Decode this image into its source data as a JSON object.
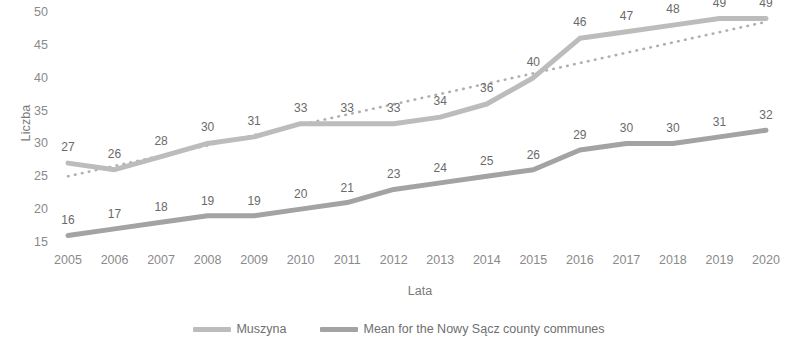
{
  "chart_data": {
    "type": "line",
    "title": "",
    "xlabel": "Lata",
    "ylabel": "Liczba",
    "categories": [
      "2005",
      "2006",
      "2007",
      "2008",
      "2009",
      "2010",
      "2011",
      "2012",
      "2013",
      "2014",
      "2015",
      "2016",
      "2017",
      "2018",
      "2019",
      "2020"
    ],
    "ylim": [
      15,
      50
    ],
    "yticks": [
      15,
      20,
      25,
      30,
      35,
      40,
      45,
      50
    ],
    "grid": false,
    "legend_position": "bottom",
    "series": [
      {
        "name": "Muszyna",
        "color": "#bcbcbc",
        "values": [
          27,
          26,
          28,
          30,
          31,
          33,
          33,
          33,
          34,
          36,
          40,
          46,
          47,
          48,
          49,
          49
        ],
        "labels": [
          "27",
          "26",
          "28",
          "30",
          "31",
          "33",
          "33",
          "33",
          "34",
          "36",
          "40",
          "46",
          "47",
          "48",
          "49",
          "49"
        ]
      },
      {
        "name": "Mean for the Nowy Sącz county communes",
        "color": "#a3a3a3",
        "values": [
          16,
          17,
          18,
          19,
          19,
          20,
          21,
          23,
          24,
          25,
          26,
          29,
          30,
          30,
          31,
          32
        ],
        "labels": [
          "16",
          "17",
          "18",
          "19",
          "19",
          "20",
          "21",
          "23",
          "24",
          "25",
          "26",
          "29",
          "30",
          "30",
          "31",
          "32"
        ]
      }
    ],
    "trendline": {
      "name": "linear-trend",
      "style": "dotted",
      "color": "#b0b0b0",
      "start_value": 25.0,
      "end_value": 48.5
    }
  },
  "legend": {
    "items": [
      {
        "label": "Muszyna",
        "color": "#bcbcbc"
      },
      {
        "label": "Mean for the Nowy Sącz county communes",
        "color": "#a3a3a3"
      }
    ]
  },
  "axes": {
    "y_title": "Liczba",
    "x_title": "Lata"
  }
}
